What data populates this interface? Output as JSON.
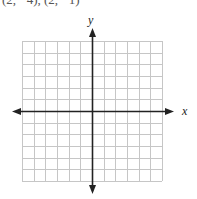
{
  "header": {
    "cropped_text": "(2, −4), (2, −1)"
  },
  "graph": {
    "x_label": "x",
    "y_label": "y",
    "grid": {
      "columns": 12,
      "rows": 12,
      "x0": 22,
      "y0": 41,
      "x1": 162,
      "y1": 181
    },
    "colors": {
      "grid": "#c6c6c6",
      "axis": "#222222",
      "background": "#ffffff"
    }
  }
}
